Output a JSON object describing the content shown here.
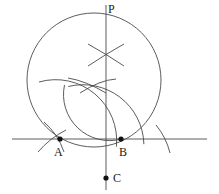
{
  "figure": {
    "stroke_color": "#4a4a4a",
    "point_color": "#111111",
    "background": "#ffffff",
    "canvas": {
      "width": 219,
      "height": 194
    }
  },
  "labels": {
    "p": "P",
    "a": "A",
    "b": "B",
    "c": "C"
  },
  "geometry": {
    "circle": {
      "cx": 94,
      "cy": 80,
      "r": 67
    },
    "horizontal_line": {
      "x1": 12,
      "y1": 139,
      "x2": 207,
      "y2": 139
    },
    "vertical_line": {
      "x1": 106,
      "y1": 5,
      "x2": 106,
      "y2": 190
    },
    "points": [
      {
        "name": "A",
        "x": 60,
        "y": 139,
        "r": 2.6
      },
      {
        "name": "B",
        "x": 121,
        "y": 139,
        "r": 2.6
      },
      {
        "name": "C",
        "x": 106,
        "y": 178,
        "r": 2.6
      },
      {
        "name": "P",
        "x": 106,
        "y": 13,
        "r": 0
      }
    ],
    "arc_from_A": {
      "cx": 60,
      "cy": 139,
      "r": 61,
      "start_deg": 250,
      "end_deg": 330
    },
    "arc_from_B": {
      "cx": 121,
      "cy": 139,
      "r": 61,
      "start_deg": 210,
      "end_deg": 292
    },
    "cross_upper": {
      "x": 106,
      "y": 55
    },
    "cross_lower": {
      "x": 93,
      "y": 83
    },
    "tick_arcs": [
      {
        "name": "tick-upper-left",
        "cx": 106,
        "cy": 55,
        "len": 30,
        "angle_deg": -30
      },
      {
        "name": "tick-upper-right",
        "cx": 106,
        "cy": 55,
        "len": 30,
        "angle_deg": 30
      },
      {
        "name": "tick-near-A",
        "cx": 55,
        "cy": 141,
        "r": 20,
        "start_deg": 300,
        "end_deg": 60
      },
      {
        "name": "tick-right-of-B",
        "cx": 148,
        "cy": 140,
        "r": 22,
        "start_deg": 310,
        "end_deg": 45
      }
    ]
  }
}
